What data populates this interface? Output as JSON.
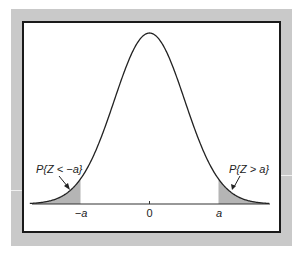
{
  "figure": {
    "colors": {
      "frame": "#c9c9c9",
      "panel_border": "#1a1a1a",
      "curve": "#222222",
      "shade": "#b5b5b5",
      "axis": "#333333"
    },
    "labels": {
      "left_tail": "P{Z < −a}",
      "right_tail": "P{Z > a}"
    },
    "ticks": [
      {
        "label": "−a",
        "value": -1.96
      },
      {
        "label": "0",
        "value": 0
      },
      {
        "label": "a",
        "value": 1.96
      }
    ]
  },
  "chart_data": {
    "type": "area",
    "title": "",
    "x_range": [
      -3.4,
      3.4
    ],
    "distribution": {
      "name": "standard normal",
      "mean": 0,
      "sd": 1
    },
    "shaded_regions": [
      {
        "from": -3.4,
        "to": -1.96,
        "label": "P{Z < −a}"
      },
      {
        "from": 1.96,
        "to": 3.4,
        "label": "P{Z > a}"
      }
    ],
    "xticks": [
      "−a",
      "0",
      "a"
    ],
    "xlabel": "",
    "ylabel": "",
    "grid": false,
    "legend": "none"
  }
}
